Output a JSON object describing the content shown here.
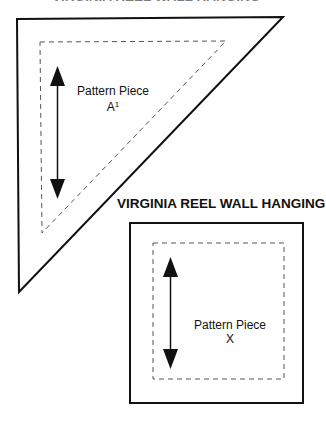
{
  "top_cut_title": "VIRGINIA REEL WALL HANGING",
  "title": "VIRGINIA REEL WALL HANGING",
  "pieces": [
    {
      "shape": "triangle",
      "label_line1": "Pattern Piece",
      "label_line2": "A",
      "label_sup": "1",
      "grain_arrow": "vertical-double"
    },
    {
      "shape": "square",
      "label_line1": "Pattern Piece",
      "label_line2": "X",
      "grain_arrow": "vertical-double"
    }
  ],
  "colors": {
    "line": "#111111",
    "dash": "#555555",
    "background": "#ffffff"
  }
}
